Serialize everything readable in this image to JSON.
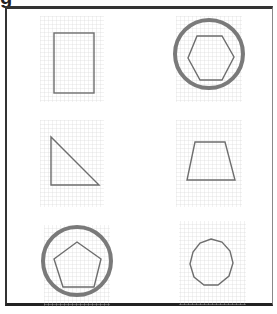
{
  "title_fragment": "g",
  "figure": {
    "panels": [
      {
        "position": "row1-left",
        "shape": "rectangle",
        "sides": 4,
        "circled": false
      },
      {
        "position": "row1-right",
        "shape": "hexagon",
        "sides": 6,
        "circled": true
      },
      {
        "position": "row2-left",
        "shape": "right triangle",
        "sides": 3,
        "circled": false
      },
      {
        "position": "row2-right",
        "shape": "trapezoid",
        "sides": 4,
        "circled": false
      },
      {
        "position": "row3-left",
        "shape": "pentagon",
        "sides": 5,
        "circled": true
      },
      {
        "position": "row3-right",
        "shape": "nonagon",
        "sides": 9,
        "circled": false
      }
    ]
  },
  "colors": {
    "frame": "#333333",
    "grid": "#d6d6d6",
    "shape_stroke": "#6e6e6e",
    "circle_stroke": "#7a7a7a"
  }
}
